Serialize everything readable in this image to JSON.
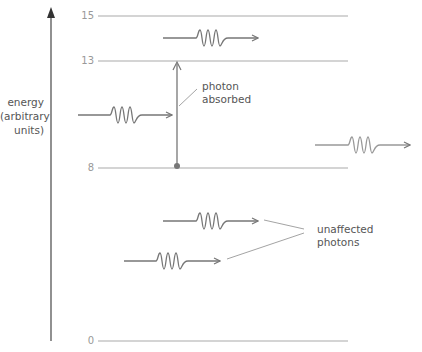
{
  "diagram": {
    "axis_label": [
      "energy",
      "(arbitrary",
      "units)"
    ],
    "levels": [
      {
        "value": "15",
        "y": 16
      },
      {
        "value": "13",
        "y": 61
      },
      {
        "value": "8",
        "y": 168
      },
      {
        "value": "0",
        "y": 341
      }
    ],
    "annotations": {
      "absorbed": [
        "photon",
        "absorbed"
      ],
      "unaffected": [
        "unaffected",
        "photons"
      ]
    },
    "colors": {
      "axis": "#555555",
      "level_line": "#999999",
      "photon": "#777777",
      "text": "#555555"
    }
  }
}
